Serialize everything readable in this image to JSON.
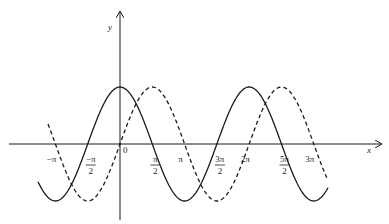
{
  "chart_data": {
    "type": "line",
    "title": "",
    "xlabel": "x",
    "ylabel": "y",
    "x_ticks": [
      {
        "label_num": "−π",
        "label_den": "",
        "value": -3.14159
      },
      {
        "label_num": "−π",
        "label_den": "2",
        "value": -1.5708
      },
      {
        "label_num": "0",
        "label_den": "",
        "value": 0
      },
      {
        "label_num": "π",
        "label_den": "2",
        "value": 1.5708
      },
      {
        "label_num": "π",
        "label_den": "",
        "value": 3.14159
      },
      {
        "label_num": "3π",
        "label_den": "2",
        "value": 4.7124
      },
      {
        "label_num": "2π",
        "label_den": "",
        "value": 6.28319
      },
      {
        "label_num": "5π",
        "label_den": "2",
        "value": 7.854
      },
      {
        "label_num": "3π",
        "label_den": "",
        "value": 9.42478
      }
    ],
    "xlim": [
      -4.0,
      10.1
    ],
    "ylim": [
      -1,
      1
    ],
    "grid": false,
    "legend": null,
    "series": [
      {
        "name": "y = cos x",
        "style": "solid",
        "x_range": [
          -3.99,
          10.12
        ],
        "function": "cos",
        "key_points": [
          [
            -3.14159,
            -1
          ],
          [
            -1.5708,
            0
          ],
          [
            0,
            1
          ],
          [
            1.5708,
            0
          ],
          [
            3.14159,
            -1
          ],
          [
            4.7124,
            0
          ],
          [
            6.28319,
            1
          ],
          [
            7.854,
            0
          ],
          [
            9.42478,
            -1
          ]
        ]
      },
      {
        "name": "y = sin x",
        "style": "dashed",
        "x_range": [
          -3.5,
          10.07
        ],
        "function": "sin",
        "key_points": [
          [
            -3.14159,
            0
          ],
          [
            -1.5708,
            -1
          ],
          [
            0,
            0
          ],
          [
            1.5708,
            1
          ],
          [
            3.14159,
            0
          ],
          [
            4.7124,
            -1
          ],
          [
            6.28319,
            0
          ],
          [
            7.854,
            1
          ],
          [
            9.42478,
            0
          ]
        ]
      }
    ]
  },
  "axes": {
    "x_label": "x",
    "y_label": "y",
    "origin_label": "0"
  },
  "colors": {
    "line": "#1a1a1a",
    "background": "#ffffff"
  }
}
